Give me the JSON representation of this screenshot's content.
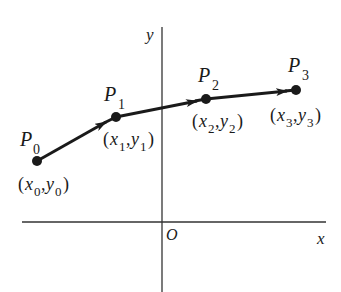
{
  "diagram": {
    "axes": {
      "x_label": "x",
      "y_label": "y",
      "origin_label": "O"
    },
    "points": [
      {
        "name": "P",
        "index": "0",
        "coord_x": "x",
        "coord_y": "y"
      },
      {
        "name": "P",
        "index": "1",
        "coord_x": "x",
        "coord_y": "y"
      },
      {
        "name": "P",
        "index": "2",
        "coord_x": "x",
        "coord_y": "y"
      },
      {
        "name": "P",
        "index": "3",
        "coord_x": "x",
        "coord_y": "y"
      }
    ],
    "colors": {
      "stroke": "#1a1a1a",
      "background": "#ffffff"
    }
  }
}
